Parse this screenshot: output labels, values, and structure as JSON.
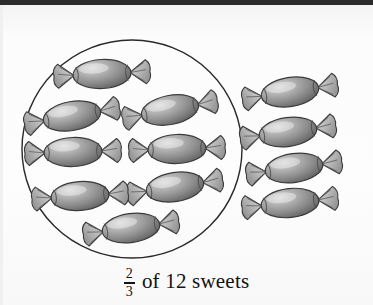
{
  "page": {
    "background_color": "#fbfbfb",
    "top_bar_color": "#2b2b2b",
    "width": 373,
    "height": 305
  },
  "illustration": {
    "title": "two thirds of twelve sweets",
    "description": "A ring drawn around 8 wrapped sweets, with 4 more wrapped sweets outside the ring to the right",
    "circle": {
      "center_x": 132,
      "center_y": 149,
      "radius": 110,
      "stroke_color": "#2a2a2a",
      "stroke_width": 1.4,
      "fill": "none"
    },
    "candy_style": {
      "body_color": "#8c8c8c",
      "body_highlight": "#d8d8d8",
      "body_shadow": "#5e5e5e",
      "wrapper_color": "#bdbdbd",
      "outline_color": "#3a3a3a"
    },
    "total_sweets": 12,
    "sweets_inside_circle": 8,
    "sweets_outside_circle": 4,
    "inside": [
      {
        "label": "sweet-1",
        "x": 102,
        "y": 74,
        "rotate": -3,
        "scale": 1.0
      },
      {
        "label": "sweet-2",
        "x": 72,
        "y": 116,
        "rotate": -10,
        "scale": 1.0
      },
      {
        "label": "sweet-3",
        "x": 170,
        "y": 110,
        "rotate": -11,
        "scale": 1.0
      },
      {
        "label": "sweet-4",
        "x": 73,
        "y": 152,
        "rotate": -2,
        "scale": 1.0
      },
      {
        "label": "sweet-5",
        "x": 177,
        "y": 149,
        "rotate": -2,
        "scale": 1.0
      },
      {
        "label": "sweet-6",
        "x": 175,
        "y": 187,
        "rotate": -9,
        "scale": 1.0
      },
      {
        "label": "sweet-7",
        "x": 80,
        "y": 196,
        "rotate": -4,
        "scale": 1.0
      },
      {
        "label": "sweet-8",
        "x": 131,
        "y": 228,
        "rotate": -8,
        "scale": 1.0
      }
    ],
    "outside": [
      {
        "label": "sweet-9",
        "x": 290,
        "y": 92,
        "rotate": -9,
        "scale": 1.0
      },
      {
        "label": "sweet-10",
        "x": 288,
        "y": 132,
        "rotate": -8,
        "scale": 1.0
      },
      {
        "label": "sweet-11",
        "x": 294,
        "y": 168,
        "rotate": -8,
        "scale": 1.0
      },
      {
        "label": "sweet-12",
        "x": 290,
        "y": 203,
        "rotate": -6,
        "scale": 1.0
      }
    ]
  },
  "caption": {
    "fraction_numerator": "2",
    "fraction_denominator": "3",
    "text": "of 12 sweets",
    "full_text": "2/3 of 12 sweets"
  }
}
